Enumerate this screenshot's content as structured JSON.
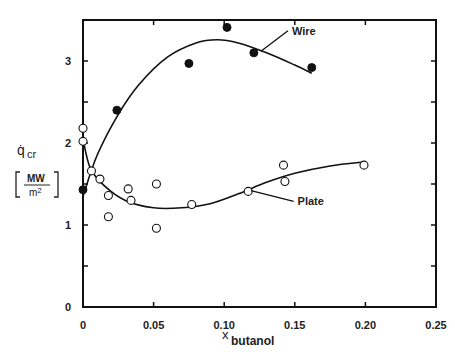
{
  "chart_data": {
    "type": "scatter",
    "title": "",
    "xlabel": "x_butanol",
    "xlabel_main": "x",
    "xlabel_sub": "butanol",
    "ylabel": "q̇_cr [MW/m²]",
    "ylabel_main": "q̇",
    "ylabel_sub": "cr",
    "yunit_num": "MW",
    "yunit_den": "m2",
    "xlim": [
      0,
      0.25
    ],
    "ylim": [
      0,
      3.5
    ],
    "xticks": [
      0,
      0.05,
      0.1,
      0.15,
      0.2,
      0.25
    ],
    "xtick_labels": [
      "0",
      "0.05",
      "0.10",
      "0.15",
      "0.20",
      "0.25"
    ],
    "yticks": [
      0,
      0.5,
      1,
      1.5,
      2,
      2.5,
      3
    ],
    "ytick_labels": [
      "0",
      "",
      "1",
      "",
      "2",
      "",
      "3"
    ],
    "grid": false,
    "legend": "inline annotations",
    "series": [
      {
        "name": "Wire",
        "marker": "filled-circle",
        "points": [
          {
            "x": 0.0,
            "y": 1.43
          },
          {
            "x": 0.024,
            "y": 2.4
          },
          {
            "x": 0.075,
            "y": 2.97
          },
          {
            "x": 0.102,
            "y": 3.41
          },
          {
            "x": 0.121,
            "y": 3.1
          },
          {
            "x": 0.162,
            "y": 2.92
          }
        ],
        "fit_curve": [
          {
            "x": 0.0,
            "y": 1.35
          },
          {
            "x": 0.01,
            "y": 1.85
          },
          {
            "x": 0.025,
            "y": 2.35
          },
          {
            "x": 0.04,
            "y": 2.72
          },
          {
            "x": 0.06,
            "y": 3.05
          },
          {
            "x": 0.08,
            "y": 3.22
          },
          {
            "x": 0.095,
            "y": 3.26
          },
          {
            "x": 0.11,
            "y": 3.22
          },
          {
            "x": 0.13,
            "y": 3.1
          },
          {
            "x": 0.15,
            "y": 2.95
          },
          {
            "x": 0.162,
            "y": 2.85
          }
        ]
      },
      {
        "name": "Plate",
        "marker": "open-circle",
        "points": [
          {
            "x": 0.0,
            "y": 2.18
          },
          {
            "x": 0.0,
            "y": 2.02
          },
          {
            "x": 0.006,
            "y": 1.66
          },
          {
            "x": 0.012,
            "y": 1.56
          },
          {
            "x": 0.018,
            "y": 1.36
          },
          {
            "x": 0.018,
            "y": 1.1
          },
          {
            "x": 0.032,
            "y": 1.44
          },
          {
            "x": 0.034,
            "y": 1.3
          },
          {
            "x": 0.052,
            "y": 1.5
          },
          {
            "x": 0.052,
            "y": 0.96
          },
          {
            "x": 0.077,
            "y": 1.25
          },
          {
            "x": 0.117,
            "y": 1.41
          },
          {
            "x": 0.142,
            "y": 1.73
          },
          {
            "x": 0.143,
            "y": 1.53
          },
          {
            "x": 0.199,
            "y": 1.73
          }
        ],
        "fit_curve": [
          {
            "x": 0.0,
            "y": 2.05
          },
          {
            "x": 0.005,
            "y": 1.7
          },
          {
            "x": 0.015,
            "y": 1.48
          },
          {
            "x": 0.03,
            "y": 1.3
          },
          {
            "x": 0.05,
            "y": 1.21
          },
          {
            "x": 0.07,
            "y": 1.21
          },
          {
            "x": 0.09,
            "y": 1.26
          },
          {
            "x": 0.11,
            "y": 1.38
          },
          {
            "x": 0.13,
            "y": 1.52
          },
          {
            "x": 0.15,
            "y": 1.63
          },
          {
            "x": 0.175,
            "y": 1.72
          },
          {
            "x": 0.2,
            "y": 1.77
          }
        ]
      }
    ],
    "annotations": [
      {
        "text": "Wire",
        "x": 0.148,
        "y": 3.32,
        "arrow_to": {
          "x": 0.126,
          "y": 3.12
        }
      },
      {
        "text": "Plate",
        "x": 0.152,
        "y": 1.24,
        "arrow_to": {
          "x": 0.119,
          "y": 1.42
        }
      }
    ]
  },
  "labels": {
    "wire": "Wire",
    "plate": "Plate"
  }
}
